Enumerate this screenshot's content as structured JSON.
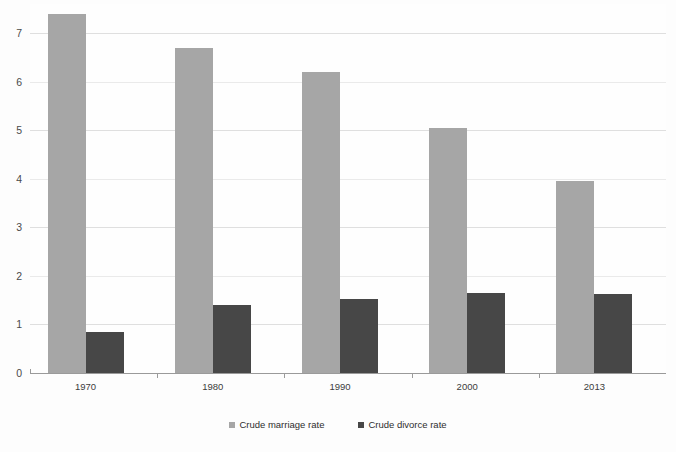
{
  "chart_data": {
    "type": "bar",
    "title": "",
    "xlabel": "",
    "ylabel": "",
    "categories": [
      "1970",
      "1980",
      "1990",
      "2000",
      "2013"
    ],
    "series": [
      {
        "name": "Crude marriage rate",
        "color": "#a6a6a6",
        "values": [
          7.4,
          6.7,
          6.2,
          5.05,
          3.95
        ]
      },
      {
        "name": "Crude divorce rate",
        "color": "#474747",
        "values": [
          0.85,
          1.4,
          1.52,
          1.65,
          1.63
        ]
      }
    ],
    "ylim": [
      0,
      7.6
    ],
    "yticks": [
      0,
      1,
      2,
      3,
      4,
      5,
      6,
      7
    ],
    "ytick_labels": [
      "0",
      "1",
      "2",
      "3",
      "4",
      "5",
      "6",
      "7"
    ],
    "grid": true,
    "legend_position": "bottom"
  },
  "legend": {
    "items": [
      {
        "label": "Crude marriage rate",
        "swatch": "marriage"
      },
      {
        "label": "Crude divorce rate",
        "swatch": "divorce"
      }
    ]
  },
  "colors": {
    "marriage": "#a6a6a6",
    "divorce": "#474747",
    "gridline": "#d9d9d9",
    "axis": "#9a9a9a",
    "background": "#fdfdfd"
  }
}
